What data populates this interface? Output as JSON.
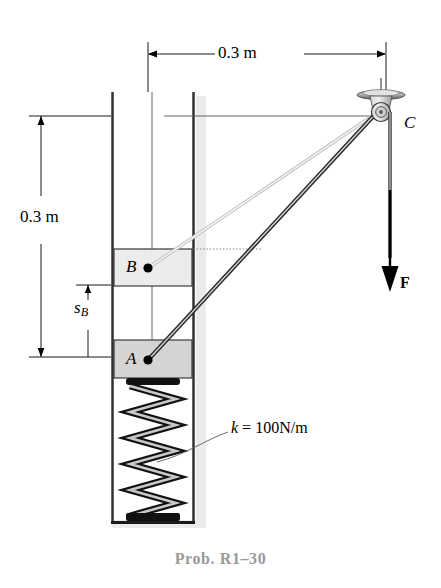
{
  "figure": {
    "caption": "Prob. R1–30",
    "background_color": "#ffffff",
    "ink_color": "#000000",
    "caption_color": "#999999"
  },
  "dimensions": {
    "horizontal": {
      "label": "0.3 m",
      "value": 0.3,
      "unit": "m",
      "orientation": "horizontal",
      "description": "horizontal distance from column centerline to pulley C"
    },
    "vertical_total": {
      "label": "0.3 m",
      "value": 0.3,
      "unit": "m",
      "orientation": "vertical",
      "description": "vertical distance from pulley level down to block A"
    },
    "vertical_sb": {
      "label_main": "s",
      "label_sub": "B",
      "label": "sB",
      "orientation": "vertical",
      "description": "position coordinate of block B measured down to block A level"
    }
  },
  "points": {
    "a": {
      "label": "A",
      "description": "lower block A attached to spring"
    },
    "b": {
      "label": "B",
      "description": "upper block B sliding in guide"
    },
    "c": {
      "label": "C",
      "description": "pulley C mounted on ceiling bracket"
    }
  },
  "force": {
    "label": "F",
    "direction": "down",
    "description": "applied force F pulling cord down from pulley C"
  },
  "spring": {
    "label_prefix": "k",
    "label_equals": "=",
    "label_value": "100N/m",
    "label": "k = 100N/m",
    "stiffness": 100,
    "unit": "N/m",
    "coils": 9
  },
  "blocks": [
    {
      "name": "block-b",
      "label": "B",
      "fill": "#ebebeb"
    },
    {
      "name": "block-a",
      "label": "A",
      "fill": "#d2d2d2"
    }
  ],
  "cords": [
    {
      "name": "cord-b-to-c",
      "from": "B",
      "to": "C",
      "style": "light"
    },
    {
      "name": "cord-a-to-c",
      "from": "A",
      "to": "C",
      "style": "dark"
    },
    {
      "name": "cord-c-to-f",
      "from": "C",
      "to": "F",
      "style": "dark"
    }
  ]
}
